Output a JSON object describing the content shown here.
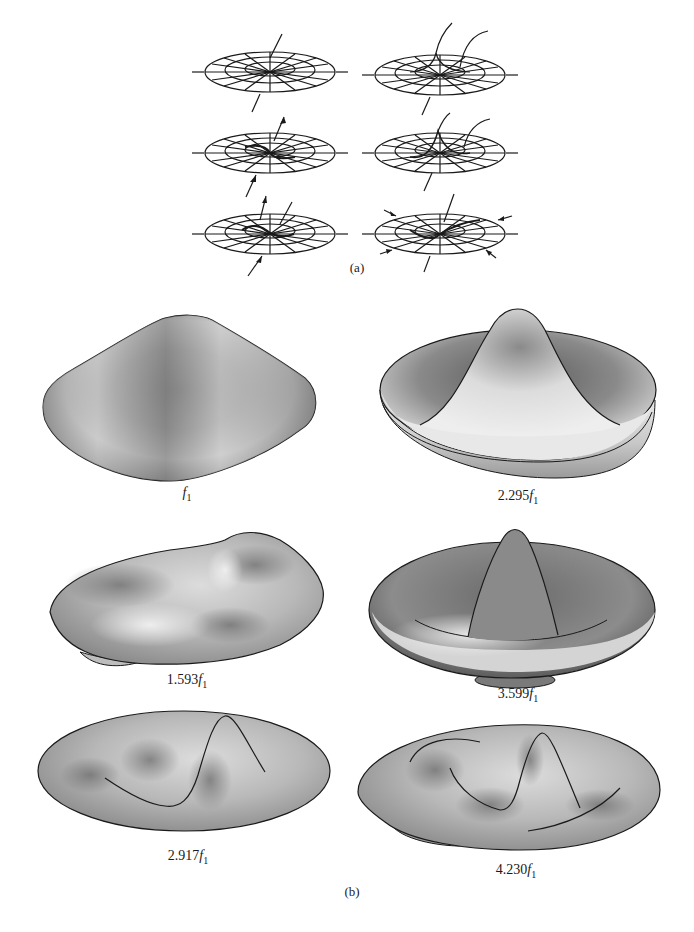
{
  "figure": {
    "part_a": {
      "label": "(a)",
      "description": "Wireframe sketches of membrane mode shapes with nodal lines",
      "sketches": [
        {
          "row": 1,
          "col": 1,
          "mode": "fundamental"
        },
        {
          "row": 1,
          "col": 2,
          "mode": "axisymmetric with nodal circle"
        },
        {
          "row": 2,
          "col": 1,
          "mode": "one nodal diameter"
        },
        {
          "row": 2,
          "col": 2,
          "mode": "nodal circle with nodal diameter"
        },
        {
          "row": 3,
          "col": 1,
          "mode": "two nodal diameters"
        },
        {
          "row": 3,
          "col": 2,
          "mode": "higher mode"
        }
      ]
    },
    "part_b": {
      "label": "(b)",
      "modes": [
        {
          "id": "m01",
          "coef": "",
          "symbol": "f",
          "sub": "1"
        },
        {
          "id": "m02",
          "coef": "2.295",
          "symbol": "f",
          "sub": "1"
        },
        {
          "id": "m11",
          "coef": "1.593",
          "symbol": "f",
          "sub": "1"
        },
        {
          "id": "m03",
          "coef": "3.599",
          "symbol": "f",
          "sub": "1"
        },
        {
          "id": "m12",
          "coef": "2.917",
          "symbol": "f",
          "sub": "1"
        },
        {
          "id": "m13",
          "coef": "4.230",
          "symbol": "f",
          "sub": "1"
        }
      ]
    },
    "colors": {
      "ink": "#1a1a1a",
      "surface_dark": "#6e6e6e",
      "surface_mid": "#a8a8a8",
      "surface_light": "#e6e6e6"
    }
  }
}
